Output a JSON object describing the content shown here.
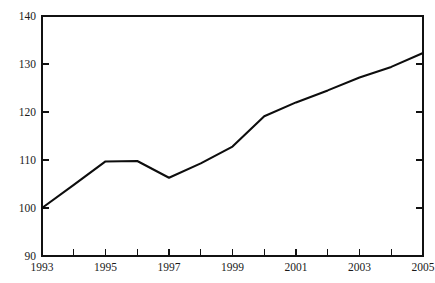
{
  "chart_data": {
    "type": "line",
    "title": "",
    "subtitle": "",
    "xlabel": "",
    "ylabel": "",
    "x": [
      1993,
      1994,
      1995,
      1996,
      1997,
      1998,
      1999,
      2000,
      2001,
      2002,
      2003,
      2004,
      2005
    ],
    "values": [
      100.0,
      104.8,
      109.7,
      109.8,
      106.3,
      109.3,
      112.8,
      119.1,
      122.0,
      124.5,
      127.2,
      129.4,
      132.3
    ],
    "series": [
      {
        "name": "Index",
        "values": [
          100.0,
          104.8,
          109.7,
          109.8,
          106.3,
          109.3,
          112.8,
          119.1,
          122.0,
          124.5,
          127.2,
          129.4,
          132.3
        ]
      }
    ],
    "xlim": [
      1993,
      2005
    ],
    "ylim": [
      90,
      140
    ],
    "ytick_values": [
      90,
      100,
      110,
      120,
      130,
      140
    ],
    "ytick_labels": [
      "90",
      "100",
      "110",
      "120",
      "130",
      "140"
    ],
    "xtick_values": [
      1993,
      1994,
      1995,
      1996,
      1997,
      1998,
      1999,
      2000,
      2001,
      2002,
      2003,
      2004,
      2005
    ],
    "xtick_labels": [
      "1993",
      "",
      "1995",
      "",
      "1997",
      "",
      "1999",
      "",
      "2001",
      "",
      "2003",
      "",
      "2005"
    ],
    "grid": false,
    "legend": false,
    "legend_position": "none",
    "annotations": [],
    "line_color": "#0d0d0d",
    "axis_color": "#111111",
    "background_color": "#ffffff",
    "plot_area": {
      "left": 42,
      "top": 16,
      "right": 423,
      "bottom": 256
    }
  }
}
